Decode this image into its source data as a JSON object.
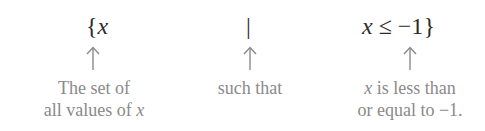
{
  "diagram": {
    "type": "set-builder-notation-annotation",
    "parts": [
      {
        "id": "set",
        "math": {
          "brace": "{",
          "variable": "x"
        },
        "caption_lines": [
          "The set of",
          "all values of x"
        ]
      },
      {
        "id": "such-that",
        "math": {
          "symbol": "|"
        },
        "caption_lines": [
          "such that"
        ]
      },
      {
        "id": "condition",
        "math": {
          "variable": "x",
          "relation": "≤",
          "value": "−1",
          "brace": "}"
        },
        "caption_lines": [
          "x is less than",
          "or equal to −1."
        ]
      }
    ],
    "colors": {
      "math_text": "#2b2b2b",
      "caption_text": "#8a8a8a",
      "arrow": "#8a8a8a",
      "background": "#ffffff"
    }
  },
  "text": {
    "set_brace": "{",
    "set_var": "x",
    "bar": "|",
    "cond_var": "x",
    "cond_rel": "≤",
    "cond_val": "−1",
    "close_brace": "}",
    "cap1_line1": "The set of",
    "cap1_line2_prefix": "all values of ",
    "cap1_line2_var": "x",
    "cap2_line1": "such that",
    "cap3_line1_var": "x",
    "cap3_line1_rest": " is less than",
    "cap3_line2": "or equal to −1."
  }
}
